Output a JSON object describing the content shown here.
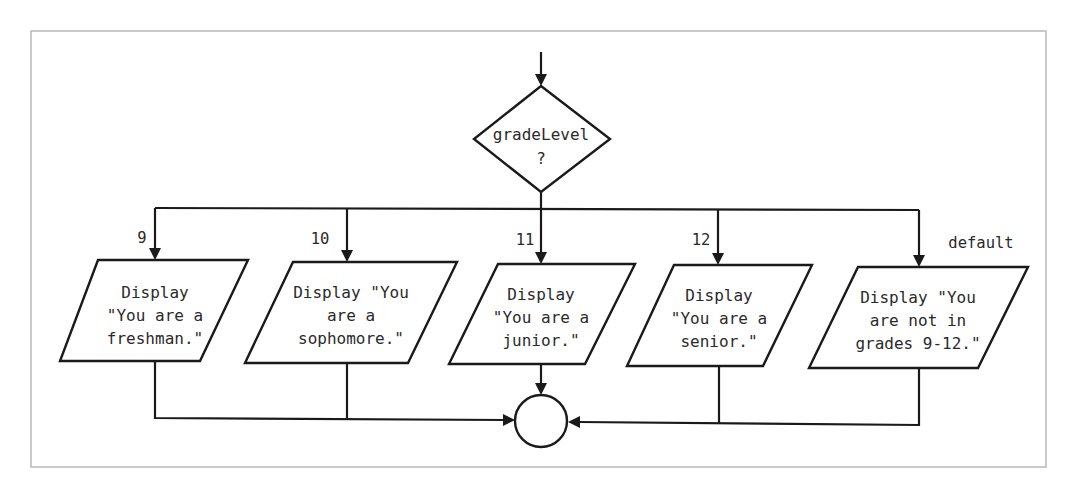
{
  "diagram": {
    "decision": {
      "lines": [
        "gradeLevel",
        "?"
      ]
    },
    "branches": [
      {
        "case_label": "9",
        "text_lines": [
          "Display",
          "\"You are a",
          "freshman.\""
        ]
      },
      {
        "case_label": "10",
        "text_lines": [
          "Display \"You",
          "are a",
          "sophomore.\""
        ]
      },
      {
        "case_label": "11",
        "text_lines": [
          "Display",
          "\"You are a",
          "junior.\""
        ]
      },
      {
        "case_label": "12",
        "text_lines": [
          "Display",
          "\"You are a",
          "senior.\""
        ]
      },
      {
        "case_label": "default",
        "text_lines": [
          "Display \"You",
          "are not in",
          "grades 9-12.\""
        ]
      }
    ],
    "connector": {
      "shape": "circle"
    },
    "colors": {
      "stroke": "#1a1a1a",
      "frame": "#b9b9b9",
      "text": "#2a2a2a",
      "background": "#ffffff"
    }
  }
}
